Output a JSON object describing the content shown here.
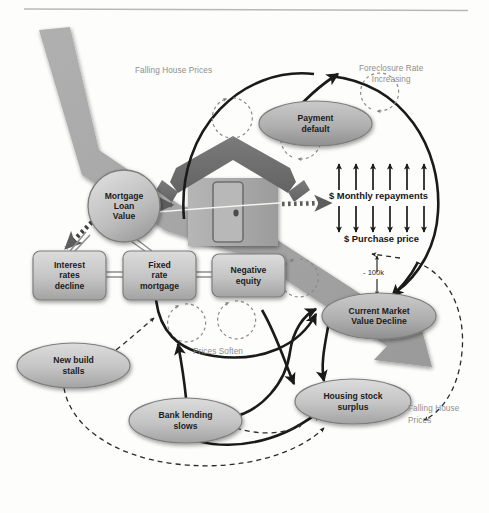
{
  "diagram": {
    "type": "causal-loop-diagram",
    "colors": {
      "background": "#fdfdfc",
      "band_gray": "#9f9f9f",
      "node_fill_light": "#cfcfcf",
      "node_fill_dark": "#ababab",
      "node_stroke": "#6d6d6d",
      "arrow_black": "#1a1a1a",
      "label_gray": "#8d8d8d",
      "house_roof": "#6e6e6e",
      "house_body": "#a8a8a8",
      "rule_gray": "#b5b5b5"
    },
    "top_rule": {
      "present": true
    },
    "annotations": [
      {
        "id": "falling-house-prices-top",
        "text": "Falling House Prices",
        "x": 135,
        "y": 66,
        "align": "left"
      },
      {
        "id": "foreclosure-rate-increasing",
        "text": "Foreclosure Rate\nIncreasing",
        "x": 359,
        "y": 64,
        "align": "left"
      },
      {
        "id": "prices-soften",
        "text": "Prices Soften",
        "x": 193,
        "y": 347,
        "align": "left"
      },
      {
        "id": "falling-house-prices-bottom",
        "text": "Falling House\nPrices",
        "x": 408,
        "y": 403,
        "align": "left"
      }
    ],
    "metrics": [
      {
        "id": "monthly-repayments",
        "text": "$ Monthly repayments",
        "direction": "up",
        "arrow_count": 6
      },
      {
        "id": "purchase-price",
        "text": "$ Purchase price",
        "direction": "down",
        "arrow_count": 6
      },
      {
        "id": "value-drop",
        "text": "- 100k",
        "direction": "down"
      }
    ],
    "nodes": [
      {
        "id": "mortgage-loan-value",
        "label": "Mortgage\nLoan\nValue",
        "shape": "circle",
        "x": 88,
        "y": 170,
        "w": 72,
        "h": 72
      },
      {
        "id": "payment-default",
        "label": "Payment\ndefault",
        "shape": "ellipse",
        "x": 259,
        "y": 101,
        "w": 113,
        "h": 45
      },
      {
        "id": "interest-rates-decline",
        "label": "Interest\nrates\ndecline",
        "shape": "box",
        "x": 33,
        "y": 251,
        "w": 73,
        "h": 49
      },
      {
        "id": "fixed-rate-mortgage",
        "label": "Fixed\nrate\nmortgage",
        "shape": "box",
        "x": 123,
        "y": 251,
        "w": 73,
        "h": 49
      },
      {
        "id": "negative-equity",
        "label": "Negative\nequity",
        "shape": "box",
        "x": 212,
        "y": 254,
        "w": 73,
        "h": 43
      },
      {
        "id": "current-market-value-decline",
        "label": "Current Market\nValue Decline",
        "shape": "ellipse",
        "x": 322,
        "y": 293,
        "w": 114,
        "h": 46
      },
      {
        "id": "new-build-stalls",
        "label": "New build\nstalls",
        "shape": "ellipse",
        "x": 17,
        "y": 343,
        "w": 113,
        "h": 45
      },
      {
        "id": "bank-lending-slows",
        "label": "Bank lending\nslows",
        "shape": "ellipse",
        "x": 129,
        "y": 398,
        "w": 113,
        "h": 45
      },
      {
        "id": "housing-stock-surplus",
        "label": "Housing stock\nsurplus",
        "shape": "ellipse",
        "x": 295,
        "y": 379,
        "w": 116,
        "h": 45
      }
    ],
    "loop_markers": [
      {
        "id": "loop-1",
        "cx": 233,
        "cy": 118,
        "r": 20
      },
      {
        "id": "loop-2",
        "cx": 371,
        "cy": 128,
        "r": 19
      },
      {
        "id": "loop-3",
        "cx": 292,
        "cy": 177,
        "r": 20
      },
      {
        "id": "loop-4",
        "cx": 300,
        "cy": 278,
        "r": 19
      },
      {
        "id": "loop-5",
        "cx": 185,
        "cy": 323,
        "r": 19
      },
      {
        "id": "loop-6",
        "cx": 235,
        "cy": 320,
        "r": 19
      }
    ],
    "links": [
      {
        "from": "mortgage-loan-value",
        "to": "house",
        "style": "dotted-thick"
      },
      {
        "from": "house",
        "to": "monthly-repayments",
        "style": "dotted-thick"
      },
      {
        "from": "mortgage-loan-value",
        "to": "interest-rates-decline",
        "style": "dotted-thick"
      },
      {
        "from": "interest-rates-decline",
        "to": "fixed-rate-mortgage",
        "style": "double-line"
      },
      {
        "from": "fixed-rate-mortgage",
        "to": "negative-equity",
        "style": "double-line"
      },
      {
        "from": "payment-default",
        "to": "foreclosure-rate-increasing",
        "style": "solid-arrow"
      },
      {
        "from": "fixed-rate-mortgage",
        "to": "current-market-value-decline",
        "style": "solid-arrow"
      },
      {
        "from": "bank-lending-slows",
        "to": "fixed-rate-mortgage",
        "style": "solid-arrow"
      },
      {
        "from": "bank-lending-slows",
        "to": "current-market-value-decline",
        "style": "solid-arrow"
      },
      {
        "from": "bank-lending-slows",
        "to": "housing-stock-surplus",
        "style": "solid-arrow"
      },
      {
        "from": "current-market-value-decline",
        "to": "housing-stock-surplus",
        "style": "solid-arrow"
      },
      {
        "from": "new-build-stalls",
        "to": "fixed-rate-mortgage",
        "style": "dashed-arrow"
      },
      {
        "from": "new-build-stalls",
        "to": "housing-stock-surplus",
        "style": "dashed-arrow"
      },
      {
        "from": "housing-stock-surplus",
        "to": "falling-house-prices-bottom",
        "style": "dashed-arrow"
      }
    ]
  }
}
